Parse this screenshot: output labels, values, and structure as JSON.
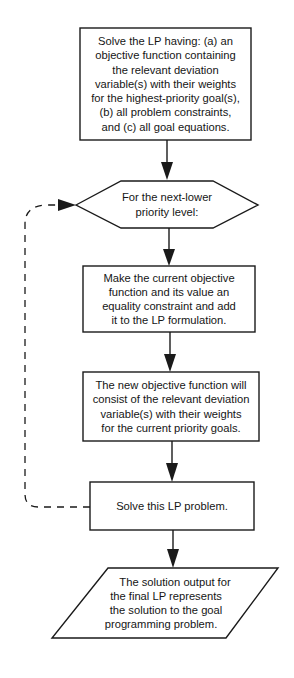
{
  "diagram": {
    "type": "flowchart",
    "colors": {
      "line": "#1a1a1a",
      "fill": "#ffffff",
      "text": "#151515"
    },
    "nodes": [
      {
        "id": "initial-solve",
        "shape": "rectangle",
        "lines": [
          "Solve the LP having: (a) an",
          "objective function containing",
          "the relevant deviation",
          "variable(s) with their weights",
          "for the highest-priority goal(s),",
          "(b) all problem constraints,",
          "and (c) all goal equations."
        ]
      },
      {
        "id": "next-priority",
        "shape": "hexagon",
        "lines": [
          "For the next-lower",
          "priority level:"
        ]
      },
      {
        "id": "add-constraint",
        "shape": "rectangle",
        "lines": [
          "Make the current objective",
          "function and its value an",
          "equality constraint and add",
          "it to the LP formulation."
        ]
      },
      {
        "id": "new-objective",
        "shape": "rectangle",
        "lines": [
          "The new objective function will",
          "consist of the relevant deviation",
          "variable(s) with their weights",
          "for the current priority goals."
        ]
      },
      {
        "id": "solve-lp",
        "shape": "rectangle",
        "lines": [
          "Solve this LP problem."
        ]
      },
      {
        "id": "final-output",
        "shape": "parallelogram",
        "lines": [
          "The solution output for",
          "the final LP represents",
          "the solution to the goal",
          "programming problem."
        ]
      }
    ],
    "edges": [
      {
        "from": "initial-solve",
        "to": "next-priority",
        "style": "solid"
      },
      {
        "from": "next-priority",
        "to": "add-constraint",
        "style": "solid"
      },
      {
        "from": "add-constraint",
        "to": "new-objective",
        "style": "solid"
      },
      {
        "from": "new-objective",
        "to": "solve-lp",
        "style": "solid"
      },
      {
        "from": "solve-lp",
        "to": "final-output",
        "style": "solid"
      },
      {
        "from": "solve-lp",
        "to": "next-priority",
        "style": "dashed",
        "label": ""
      }
    ]
  }
}
